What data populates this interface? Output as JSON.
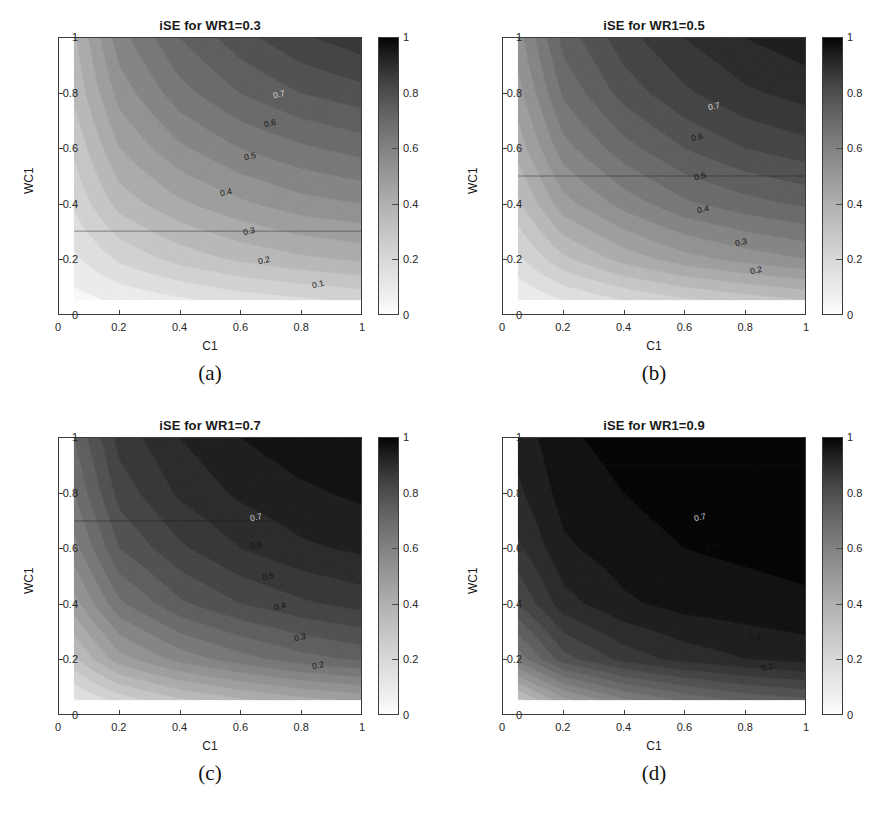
{
  "figure": {
    "axis_x_label": "C1",
    "axis_y_label": "WC1",
    "x_ticks": [
      "0",
      "0.2",
      "0.4",
      "0.6",
      "0.8",
      "1"
    ],
    "y_ticks": [
      "0",
      "0.2",
      "0.4",
      "0.6",
      "0.8",
      "1"
    ],
    "colorbar_ticks": [
      "0",
      "0.2",
      "0.4",
      "0.6",
      "0.8",
      "1"
    ],
    "colormap": "grayscale-inverted",
    "color_min": "#ffffff",
    "color_max": "#000000"
  },
  "panels": [
    {
      "caption": "(a)",
      "title": "iSE for WR1=0.3",
      "wr1": 0.3,
      "contour_labels": [
        "0.1",
        "0.2",
        "0.3",
        "0.4",
        "0.5",
        "0.6",
        "0.7"
      ]
    },
    {
      "caption": "(b)",
      "title": "iSE for WR1=0.5",
      "wr1": 0.5,
      "contour_labels": [
        "0.2",
        "0.3",
        "0.4",
        "0.5",
        "0.6",
        "0.7"
      ]
    },
    {
      "caption": "(c)",
      "title": "iSE for WR1=0.7",
      "wr1": 0.7,
      "contour_labels": [
        "0.2",
        "0.3",
        "0.4",
        "0.5",
        "0.6",
        "0.7"
      ]
    },
    {
      "caption": "(d)",
      "title": "iSE for WR1=0.9",
      "wr1": 0.9,
      "contour_labels": [
        "0.2",
        "0.3",
        "0.4",
        "0.5",
        "0.6",
        "0.7"
      ]
    }
  ],
  "chart_data": {
    "type": "heatmap",
    "xlabel": "C1",
    "ylabel": "WC1",
    "zlabel": "iSE",
    "xlim": [
      0,
      1
    ],
    "ylim": [
      0,
      1
    ],
    "zlim": [
      0,
      1
    ],
    "data_xlim": [
      0.05,
      1.0
    ],
    "data_ylim": [
      0.05,
      1.0
    ],
    "grid": false,
    "legend": "colorbar-right",
    "contour_levels": [
      0.1,
      0.2,
      0.3,
      0.4,
      0.5,
      0.6,
      0.7,
      0.8,
      0.9
    ],
    "colorbar_ticks": [
      0,
      0.2,
      0.4,
      0.6,
      0.8,
      1
    ],
    "panels": [
      {
        "caption": "(a)",
        "title": "iSE for WR1=0.3",
        "wr1": 0.3,
        "x": [
          0.05,
          0.2,
          0.4,
          0.6,
          0.8,
          1.0
        ],
        "y": [
          0.05,
          0.2,
          0.4,
          0.6,
          0.8,
          1.0
        ],
        "z": [
          [
            0.03,
            0.06,
            0.09,
            0.12,
            0.14,
            0.16
          ],
          [
            0.09,
            0.16,
            0.22,
            0.26,
            0.29,
            0.31
          ],
          [
            0.16,
            0.27,
            0.34,
            0.39,
            0.43,
            0.45
          ],
          [
            0.21,
            0.35,
            0.44,
            0.5,
            0.54,
            0.57
          ],
          [
            0.26,
            0.42,
            0.53,
            0.6,
            0.65,
            0.68
          ],
          [
            0.29,
            0.48,
            0.6,
            0.68,
            0.74,
            0.78
          ]
        ],
        "horizontal_contour_at_y": 0.3,
        "horizontal_contour_value": 0.3
      },
      {
        "caption": "(b)",
        "title": "iSE for WR1=0.5",
        "wr1": 0.5,
        "x": [
          0.05,
          0.2,
          0.4,
          0.6,
          0.8,
          1.0
        ],
        "y": [
          0.05,
          0.2,
          0.4,
          0.6,
          0.8,
          1.0
        ],
        "z": [
          [
            0.05,
            0.1,
            0.15,
            0.19,
            0.22,
            0.25
          ],
          [
            0.14,
            0.24,
            0.32,
            0.38,
            0.42,
            0.45
          ],
          [
            0.24,
            0.38,
            0.47,
            0.54,
            0.58,
            0.61
          ],
          [
            0.32,
            0.48,
            0.58,
            0.65,
            0.7,
            0.73
          ],
          [
            0.38,
            0.56,
            0.67,
            0.74,
            0.79,
            0.82
          ],
          [
            0.43,
            0.62,
            0.73,
            0.8,
            0.85,
            0.88
          ]
        ],
        "horizontal_contour_at_y": 0.5,
        "horizontal_contour_value": 0.5
      },
      {
        "caption": "(c)",
        "title": "iSE for WR1=0.7",
        "wr1": 0.7,
        "x": [
          0.05,
          0.2,
          0.4,
          0.6,
          0.8,
          1.0
        ],
        "y": [
          0.05,
          0.2,
          0.4,
          0.6,
          0.8,
          1.0
        ],
        "z": [
          [
            0.09,
            0.17,
            0.24,
            0.29,
            0.33,
            0.36
          ],
          [
            0.24,
            0.38,
            0.47,
            0.53,
            0.58,
            0.61
          ],
          [
            0.38,
            0.54,
            0.64,
            0.7,
            0.74,
            0.77
          ],
          [
            0.48,
            0.65,
            0.74,
            0.8,
            0.84,
            0.86
          ],
          [
            0.55,
            0.72,
            0.81,
            0.86,
            0.89,
            0.91
          ],
          [
            0.6,
            0.77,
            0.85,
            0.9,
            0.93,
            0.94
          ]
        ],
        "horizontal_contour_at_y": 0.7,
        "horizontal_contour_value": 0.7
      },
      {
        "caption": "(d)",
        "title": "iSE for WR1=0.9",
        "wr1": 0.9,
        "x": [
          0.05,
          0.2,
          0.4,
          0.6,
          0.8,
          1.0
        ],
        "y": [
          0.05,
          0.2,
          0.4,
          0.6,
          0.8,
          1.0
        ],
        "z": [
          [
            0.23,
            0.38,
            0.49,
            0.56,
            0.61,
            0.64
          ],
          [
            0.52,
            0.68,
            0.77,
            0.82,
            0.85,
            0.87
          ],
          [
            0.7,
            0.83,
            0.89,
            0.92,
            0.93,
            0.94
          ],
          [
            0.79,
            0.89,
            0.93,
            0.95,
            0.96,
            0.97
          ],
          [
            0.84,
            0.92,
            0.95,
            0.97,
            0.98,
            0.98
          ],
          [
            0.87,
            0.94,
            0.97,
            0.98,
            0.99,
            0.99
          ]
        ],
        "horizontal_contour_at_y": 0.9,
        "horizontal_contour_value": 0.9
      }
    ]
  }
}
